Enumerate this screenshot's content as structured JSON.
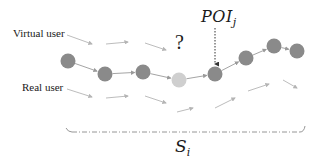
{
  "diagram": {
    "labels": {
      "virtual_user": "Virtual user",
      "real_user": "Real user",
      "unknown": "?",
      "poi": {
        "base": "POI",
        "sub": "j"
      },
      "segment": {
        "base": "S",
        "sub": "i"
      }
    },
    "colors": {
      "node": "#8a8a8a",
      "missing_node": "#cfcfcf",
      "edge": "#9a9a9a",
      "faint_arrow": "#b4b4b4",
      "text": "#1a1a1a",
      "poi_pointer": "#333333"
    },
    "trajectory_nodes": [
      {
        "id": 1,
        "x": 68,
        "y": 61,
        "state": "observed"
      },
      {
        "id": 2,
        "x": 105,
        "y": 74,
        "state": "observed"
      },
      {
        "id": 3,
        "x": 143,
        "y": 72,
        "state": "observed"
      },
      {
        "id": 4,
        "x": 179,
        "y": 80,
        "state": "missing"
      },
      {
        "id": 5,
        "x": 215,
        "y": 74,
        "state": "poi"
      },
      {
        "id": 6,
        "x": 246,
        "y": 58,
        "state": "observed"
      },
      {
        "id": 7,
        "x": 274,
        "y": 46,
        "state": "observed"
      },
      {
        "id": 8,
        "x": 297,
        "y": 51,
        "state": "observed"
      }
    ],
    "virtual_user_arrows": [
      {
        "x1": 67,
        "y1": 35,
        "x2": 92,
        "y2": 44
      },
      {
        "x1": 106,
        "y1": 44,
        "x2": 128,
        "y2": 42
      },
      {
        "x1": 145,
        "y1": 43,
        "x2": 166,
        "y2": 50
      }
    ],
    "real_user_arrows": [
      {
        "x1": 67,
        "y1": 89,
        "x2": 92,
        "y2": 97
      },
      {
        "x1": 106,
        "y1": 98,
        "x2": 128,
        "y2": 96
      },
      {
        "x1": 145,
        "y1": 96,
        "x2": 166,
        "y2": 103
      },
      {
        "x1": 177,
        "y1": 112,
        "x2": 193,
        "y2": 108
      },
      {
        "x1": 215,
        "y1": 108,
        "x2": 235,
        "y2": 98
      },
      {
        "x1": 248,
        "y1": 91,
        "x2": 269,
        "y2": 84
      },
      {
        "x1": 283,
        "y1": 80,
        "x2": 297,
        "y2": 88
      }
    ]
  }
}
